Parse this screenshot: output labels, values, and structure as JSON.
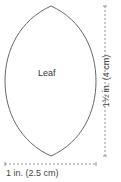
{
  "diagram": {
    "shape_label": "Leaf",
    "width_dimension": "1 in. (2.5 cm)",
    "height_dimension": "1½ in. (4 cm)",
    "colors": {
      "outline": "#666666",
      "dimension_line": "#777777",
      "text": "#444444"
    }
  }
}
